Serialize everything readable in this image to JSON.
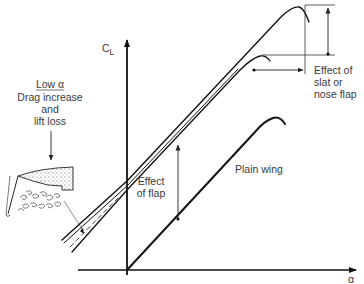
{
  "diagram": {
    "type": "lift-curve-comparison",
    "axes": {
      "y_label_main": "C",
      "y_label_sub": "L",
      "x_label": "α"
    },
    "curves": [
      {
        "name": "Plain wing"
      },
      {
        "name": "With flap"
      },
      {
        "name": "With flap and slat (nose flap)"
      }
    ],
    "annotations": {
      "low_alpha_title": "Low α",
      "low_alpha_lines": [
        "Drag increase",
        "and",
        "lift loss"
      ],
      "effect_of_flap_lines": [
        "Effect",
        "of flap"
      ],
      "effect_of_slat_lines": [
        "Effect of",
        "slat or",
        "nose flap"
      ],
      "plain_wing": "Plain wing"
    },
    "colors": {
      "ink": "#111111",
      "text": "#3a3a3a",
      "background": "#ffffff"
    }
  }
}
